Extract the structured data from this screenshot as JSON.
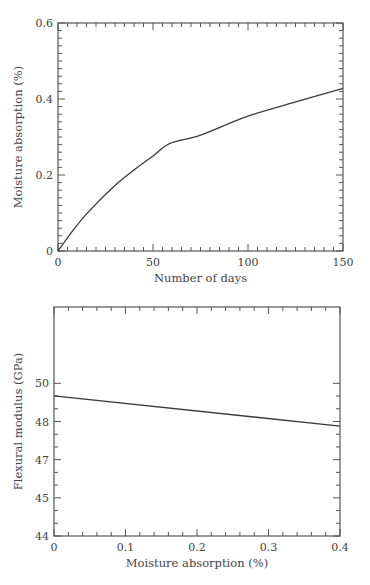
{
  "chart_data": [
    {
      "type": "line",
      "title": "",
      "xlabel": "Number of days",
      "ylabel": "Moisture absorption (%)",
      "xlim": [
        0,
        150
      ],
      "ylim": [
        0,
        0.6
      ],
      "x_ticks": [
        0,
        50,
        100,
        150
      ],
      "x_tick_labels": [
        "0",
        "50",
        "100",
        "150"
      ],
      "y_ticks": [
        0,
        0.2,
        0.4,
        0.6
      ],
      "y_tick_labels": [
        "0",
        "0.2",
        "0.4",
        "0.6"
      ],
      "x_minor_per_major": 9,
      "y_minor_per_major": 9,
      "grid": false,
      "legend": null,
      "series": [
        {
          "name": "Moisture absorption",
          "x": [
            0,
            8,
            16,
            29,
            40,
            50,
            59,
            75,
            100,
            127,
            150
          ],
          "y": [
            0,
            0.055,
            0.103,
            0.168,
            0.213,
            0.25,
            0.283,
            0.305,
            0.355,
            0.395,
            0.428
          ]
        }
      ]
    },
    {
      "type": "line",
      "title": "",
      "xlabel": "Moisture absorption (%)",
      "ylabel": "Flexural modulus (GPa)",
      "xlim": [
        0,
        0.4
      ],
      "ylim": [
        44,
        50
      ],
      "x_ticks": [
        0,
        0.1,
        0.2,
        0.3,
        0.4
      ],
      "x_tick_labels": [
        "0",
        "0.1",
        "0.2",
        "0.3",
        "0.4"
      ],
      "y_ticks": [
        44,
        45,
        46,
        47,
        48
      ],
      "y_tick_labels": [
        "44",
        "45",
        "47",
        "48",
        "50"
      ],
      "y_tick_note": "Tick labels printed as 44, 45, 47, 48, 50 at evenly spaced positions",
      "x_minor_per_major": 4,
      "y_minor_per_major": 2,
      "grid": false,
      "legend": null,
      "series": [
        {
          "name": "Flexural modulus",
          "x": [
            0,
            0.4
          ],
          "y": [
            47.67,
            46.88
          ]
        }
      ]
    }
  ]
}
